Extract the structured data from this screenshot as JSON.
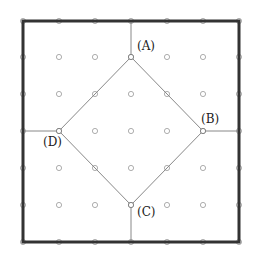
{
  "diagram": {
    "type": "grid-with-inscribed-square",
    "grid": {
      "x": [
        23,
        59,
        95,
        131,
        167,
        203,
        239
      ],
      "y": [
        21,
        57,
        94,
        131,
        168,
        205,
        242
      ],
      "dot_color": "#999999"
    },
    "border": {
      "x1": 23,
      "y1": 21,
      "x2": 239,
      "y2": 242,
      "color": "#333333",
      "width": 3
    },
    "vertices": [
      {
        "id": "A",
        "label": "(A)",
        "x": 131,
        "y": 57,
        "lx": 137,
        "ly": 50
      },
      {
        "id": "B",
        "label": "(B)",
        "x": 203,
        "y": 131,
        "lx": 201,
        "ly": 123
      },
      {
        "id": "C",
        "label": "(C)",
        "x": 131,
        "y": 205,
        "lx": 137,
        "ly": 216
      },
      {
        "id": "D",
        "label": "(D)",
        "x": 59,
        "y": 131,
        "lx": 43,
        "ly": 146
      }
    ],
    "connectors": [
      {
        "from": "A",
        "to_border": [
          131,
          21
        ]
      },
      {
        "from": "B",
        "to_border": [
          239,
          131
        ]
      },
      {
        "from": "C",
        "to_border": [
          131,
          242
        ]
      },
      {
        "from": "D",
        "to_border": [
          23,
          131
        ]
      }
    ],
    "line_color": "#888888"
  }
}
